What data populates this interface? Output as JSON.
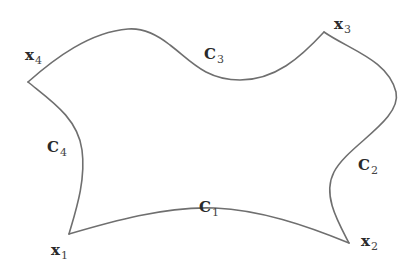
{
  "diagram": {
    "stroke_color": "#6f6f6f",
    "text_color": "#2a2a2a",
    "points": [
      {
        "id": "x1",
        "main": "x",
        "sub": "1"
      },
      {
        "id": "x2",
        "main": "x",
        "sub": "2"
      },
      {
        "id": "x3",
        "main": "x",
        "sub": "3"
      },
      {
        "id": "x4",
        "main": "x",
        "sub": "4"
      }
    ],
    "curves": [
      {
        "id": "C1",
        "main": "C",
        "sub": "1",
        "from": "x1",
        "to": "x2"
      },
      {
        "id": "C2",
        "main": "C",
        "sub": "2",
        "from": "x2",
        "to": "x3"
      },
      {
        "id": "C3",
        "main": "C",
        "sub": "3",
        "from": "x3",
        "to": "x4"
      },
      {
        "id": "C4",
        "main": "C",
        "sub": "4",
        "from": "x4",
        "to": "x1"
      }
    ]
  }
}
